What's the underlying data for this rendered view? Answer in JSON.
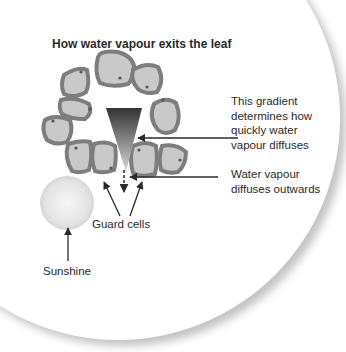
{
  "title": "How water vapour exits the leaf",
  "labels": {
    "gradient": [
      "This gradient",
      "determines how",
      "quickly water",
      "vapour diffuses"
    ],
    "diffuses": [
      "Water vapour",
      "diffuses outwards"
    ],
    "guard_cells": "Guard cells",
    "sunshine": "Sunshine"
  },
  "colors": {
    "cell_fill": "#c9c9c9",
    "cell_border": "#7d7d7d",
    "gradient_top": "#3a3a3a",
    "gradient_bottom": "#d0d0d0",
    "arrow": "#2a2a2a",
    "text": "#2a2a2a"
  }
}
